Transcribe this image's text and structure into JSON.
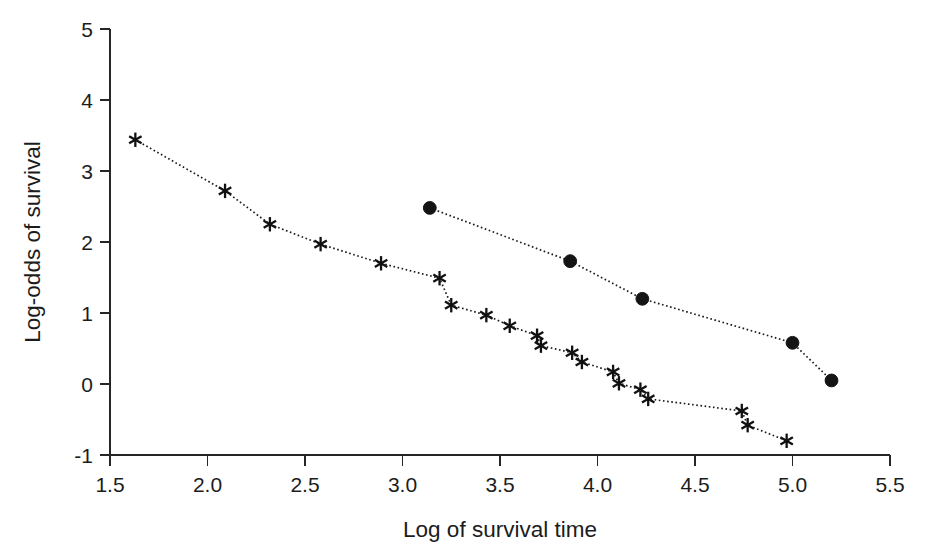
{
  "chart_data": {
    "type": "scatter",
    "title": "",
    "xlabel": "Log of survival time",
    "ylabel": "Log-odds of survival",
    "xlim": [
      1.5,
      5.5
    ],
    "ylim": [
      -1,
      5
    ],
    "xticks": [
      "1.5",
      "2.0",
      "2.5",
      "3.0",
      "3.5",
      "4.0",
      "4.5",
      "5.0",
      "5.5"
    ],
    "xtick_values": [
      1.5,
      2.0,
      2.5,
      3.0,
      3.5,
      4.0,
      4.5,
      5.0,
      5.5
    ],
    "yticks": [
      "5",
      "4",
      "3",
      "2",
      "1",
      "0",
      "-1"
    ],
    "ytick_values": [
      5,
      4,
      3,
      2,
      1,
      0,
      -1
    ],
    "grid": false,
    "legend": "none",
    "marker_color": "#141414",
    "line_style": "dotted",
    "series": [
      {
        "name": "asterisk-series",
        "marker": "asterisk",
        "x": [
          1.63,
          2.09,
          2.32,
          2.58,
          2.89,
          3.19,
          3.25,
          3.43,
          3.55,
          3.69,
          3.71,
          3.87,
          3.92,
          4.08,
          4.11,
          4.22,
          4.26,
          4.74,
          4.77,
          4.97
        ],
        "y": [
          3.44,
          2.72,
          2.25,
          1.97,
          1.7,
          1.49,
          1.11,
          0.97,
          0.82,
          0.68,
          0.54,
          0.44,
          0.31,
          0.17,
          0.01,
          -0.08,
          -0.21,
          -0.38,
          -0.58,
          -0.8
        ]
      },
      {
        "name": "circle-series",
        "marker": "filled-circle",
        "x": [
          3.14,
          3.86,
          4.23,
          5.0,
          5.2
        ],
        "y": [
          2.48,
          1.73,
          1.2,
          0.58,
          0.05
        ]
      }
    ]
  },
  "axes": {
    "x_title": "Log of survival time",
    "y_title": "Log-odds of survival"
  }
}
